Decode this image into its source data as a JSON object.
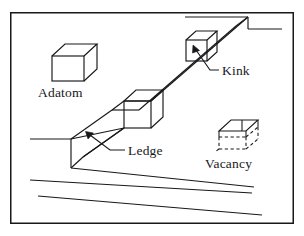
{
  "figure": {
    "background_color": "#ffffff",
    "line_color": "#18181a",
    "width": 304,
    "height": 236,
    "frame": {
      "x": 10,
      "y": 12,
      "width": 284,
      "height": 212
    }
  },
  "labels": {
    "adatom": "Adatom",
    "kink": "Kink",
    "ledge": "Ledge",
    "vacancy": "Vacancy"
  },
  "label_positions": {
    "adatom": {
      "x": 38,
      "y": 97
    },
    "kink": {
      "x": 222,
      "y": 75
    },
    "ledge": {
      "x": 128,
      "y": 155
    },
    "vacancy": {
      "x": 205,
      "y": 168
    }
  },
  "shapes": {
    "adatom_cube": {
      "type": "solid-cube",
      "front_face": [
        [
          52,
          55
        ],
        [
          84,
          55
        ],
        [
          84,
          81
        ],
        [
          52,
          81
        ]
      ],
      "top_back_offset": [
        13,
        -12
      ]
    },
    "ledge_cube": {
      "type": "solid-cube",
      "front_face": [
        [
          124,
          101
        ],
        [
          151,
          101
        ],
        [
          151,
          128
        ],
        [
          124,
          128
        ]
      ],
      "top_back_offset": [
        12,
        -11
      ]
    },
    "kink_cube": {
      "type": "solid-cube",
      "front_face": [
        [
          186,
          40
        ],
        [
          206,
          40
        ],
        [
          206,
          60
        ],
        [
          186,
          60
        ]
      ],
      "top_back_offset": [
        11,
        -10
      ]
    },
    "vacancy_cube": {
      "type": "dashed-cube",
      "front_face": [
        [
          219,
          130
        ],
        [
          251,
          130
        ],
        [
          251,
          148
        ],
        [
          219,
          148
        ]
      ],
      "top_back_offset": [
        12,
        -11
      ],
      "solid_edges": "top face and upper front",
      "dashed_edges": "lower and hidden edges"
    },
    "terrace_top_line": {
      "from": [
        185,
        17
      ],
      "to": [
        248,
        17
      ]
    },
    "terrace_right_line": {
      "from": [
        248,
        29
      ],
      "to": [
        282,
        29
      ]
    },
    "terrace_left_line": {
      "from": [
        30,
        139
      ],
      "to": [
        71,
        139
      ]
    },
    "bottom_line_1": {
      "from": [
        30,
        180
      ],
      "to": [
        252,
        193
      ]
    },
    "bottom_line_2": {
      "from": [
        38,
        192
      ],
      "to": [
        260,
        213
      ]
    }
  },
  "annotations": {
    "kink_arrow": {
      "from": [
        216,
        71
      ],
      "to": [
        195,
        49
      ],
      "label": "Kink"
    },
    "ledge_arrow": {
      "from": [
        126,
        150
      ],
      "to": [
        88,
        133
      ],
      "label": "Ledge"
    }
  }
}
